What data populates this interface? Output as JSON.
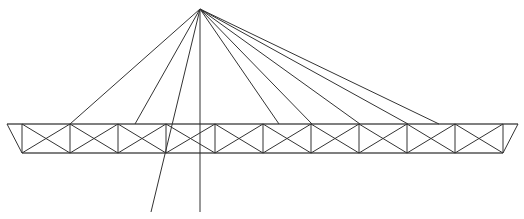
{
  "diagram": {
    "type": "cable-stayed truss",
    "stroke_color": "#333333",
    "background": "#ffffff",
    "apex": [
      200,
      9
    ],
    "truss": {
      "top_y": 124,
      "bottom_y": 153,
      "top_left_x": 7,
      "top_right_x": 518,
      "verticals_x": [
        22,
        70,
        118,
        166,
        215,
        263,
        311,
        359,
        407,
        455,
        503
      ]
    },
    "cables": [
      {
        "to": [
          70,
          124
        ]
      },
      {
        "to": [
          135,
          124
        ]
      },
      {
        "to": [
          151,
          212
        ]
      },
      {
        "to": [
          200,
          212
        ]
      },
      {
        "to": [
          279,
          124
        ]
      },
      {
        "to": [
          312,
          124
        ]
      },
      {
        "to": [
          360,
          124
        ]
      },
      {
        "to": [
          408,
          124
        ]
      },
      {
        "to": [
          439,
          124
        ]
      }
    ]
  }
}
